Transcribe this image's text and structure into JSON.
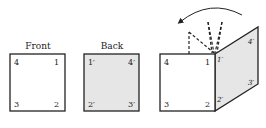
{
  "labels": {
    "front_title": "Front",
    "back_title": "Back"
  },
  "front": {
    "top_left": "4",
    "top_right": "1",
    "bottom_left": "3",
    "bottom_right": "2"
  },
  "back": {
    "top_left": "1′",
    "top_right": "4′",
    "bottom_left": "2′",
    "bottom_right": "3′"
  },
  "folded": {
    "front_top_left": "4",
    "front_top_right": "1",
    "front_bottom_left": "3",
    "front_bottom_right": "2",
    "flap_hinge_top": "1′",
    "flap_far_top": "4′",
    "flap_far_bottom": "3′",
    "flap_hinge_bottom": "2′"
  },
  "colors": {
    "stroke": "#222222",
    "back_fill": "#e6e6e6",
    "front_fill": "#ffffff"
  }
}
